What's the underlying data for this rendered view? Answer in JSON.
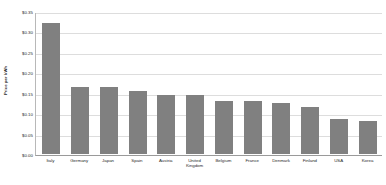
{
  "chart_data": {
    "type": "bar",
    "title": "",
    "xlabel": "",
    "ylabel": "Price per kWh",
    "categories": [
      "Italy",
      "Germany",
      "Japan",
      "Spain",
      "Austria",
      "United Kingdom",
      "Belgium",
      "France",
      "Denmark",
      "Finland",
      "USA",
      "Korea"
    ],
    "values": [
      0.32,
      0.165,
      0.165,
      0.155,
      0.145,
      0.145,
      0.13,
      0.13,
      0.125,
      0.115,
      0.085,
      0.08
    ],
    "ylim": [
      0,
      0.35
    ],
    "ytick_values": [
      0,
      0.05,
      0.1,
      0.15,
      0.2,
      0.25,
      0.3,
      0.35
    ],
    "ytick_labels": [
      "$0.00",
      "$0.05",
      "$0.10",
      "$0.15",
      "$0.20",
      "$0.25",
      "$0.30",
      "$0.35"
    ],
    "grid": true,
    "legend": false,
    "series": [
      {
        "name": "Price per kWh",
        "color": "#808080",
        "values": [
          0.32,
          0.165,
          0.165,
          0.155,
          0.145,
          0.145,
          0.13,
          0.13,
          0.125,
          0.115,
          0.085,
          0.08
        ]
      }
    ]
  },
  "colors": {
    "bar": "#808080",
    "gridline": "#dddddd",
    "axis": "#9a9a9a",
    "background": "#ffffff",
    "text": "#2a2a2a"
  }
}
